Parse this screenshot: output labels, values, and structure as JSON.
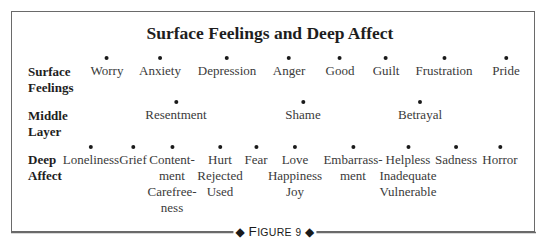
{
  "title": "Surface Feelings and Deep Affect",
  "rows": [
    {
      "label_lines": [
        "Surface",
        "Feelings"
      ],
      "items": [
        {
          "lines": [
            "Worry"
          ],
          "x": 107
        },
        {
          "lines": [
            "Anxiety"
          ],
          "x": 160
        },
        {
          "lines": [
            "Depression"
          ],
          "x": 227
        },
        {
          "lines": [
            "Anger"
          ],
          "x": 289
        },
        {
          "lines": [
            "Good"
          ],
          "x": 340
        },
        {
          "lines": [
            "Guilt"
          ],
          "x": 386
        },
        {
          "lines": [
            "Frustration"
          ],
          "x": 444
        },
        {
          "lines": [
            "Pride"
          ],
          "x": 506
        }
      ]
    },
    {
      "label_lines": [
        "Middle",
        "Layer"
      ],
      "items": [
        {
          "lines": [
            "Resentment"
          ],
          "x": 176
        },
        {
          "lines": [
            "Shame"
          ],
          "x": 303
        },
        {
          "lines": [
            "Betrayal"
          ],
          "x": 420
        }
      ]
    },
    {
      "label_lines": [
        "Deep",
        "Affect"
      ],
      "items": [
        {
          "lines": [
            "Loneliness"
          ],
          "x": 91
        },
        {
          "lines": [
            "Grief"
          ],
          "x": 133
        },
        {
          "lines": [
            "Content-",
            "ment",
            "Carefree-",
            "ness"
          ],
          "x": 172
        },
        {
          "lines": [
            "Hurt",
            "Rejected",
            "Used"
          ],
          "x": 220
        },
        {
          "lines": [
            "Fear"
          ],
          "x": 256
        },
        {
          "lines": [
            "Love",
            "Happiness",
            "Joy"
          ],
          "x": 295
        },
        {
          "lines": [
            "Embarrass-",
            "ment"
          ],
          "x": 353
        },
        {
          "lines": [
            "Helpless",
            "Inadequate",
            "Vulnerable"
          ],
          "x": 408
        },
        {
          "lines": [
            "Sadness"
          ],
          "x": 456
        },
        {
          "lines": [
            "Horror"
          ],
          "x": 500
        }
      ]
    }
  ],
  "caption": {
    "left_glyph": "◆",
    "word_initial": "F",
    "word_rest": "IGURE",
    "number": "9",
    "right_glyph": "◆"
  }
}
